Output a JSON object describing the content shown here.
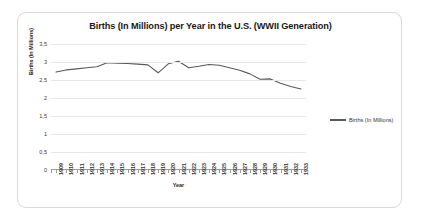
{
  "chart_data": {
    "type": "line",
    "title": "Births (In Millions) per Year in the U.S. (WWII Generation)",
    "xlabel": "Year",
    "ylabel": "Births (In Millions)",
    "ylim": [
      0,
      3.5
    ],
    "ytick_labels": [
      "0",
      "0,5",
      "1",
      "1,5",
      "2",
      "2,5",
      "3",
      "3,5"
    ],
    "ytick_values": [
      0,
      0.5,
      1,
      1.5,
      2,
      2.5,
      3,
      3.5
    ],
    "grid": true,
    "legend_position": "right",
    "categories": [
      "1909",
      "1910",
      "1911",
      "1912",
      "1913",
      "1914",
      "1915",
      "1916",
      "1917",
      "1918",
      "1919",
      "1920",
      "1921",
      "1922",
      "1923",
      "1924",
      "1925",
      "1926",
      "1927",
      "1928",
      "1929",
      "1930",
      "1931",
      "1932",
      "1933"
    ],
    "series": [
      {
        "name": "Births (In Millions)",
        "color": "#595959",
        "values": [
          2.72,
          2.78,
          2.81,
          2.84,
          2.87,
          2.98,
          2.97,
          2.96,
          2.94,
          2.92,
          2.7,
          2.95,
          3.02,
          2.84,
          2.88,
          2.93,
          2.91,
          2.84,
          2.77,
          2.67,
          2.52,
          2.53,
          2.41,
          2.32,
          2.25
        ]
      }
    ]
  },
  "legend": {
    "entries": [
      {
        "label": "Births (In Millions)"
      }
    ]
  }
}
